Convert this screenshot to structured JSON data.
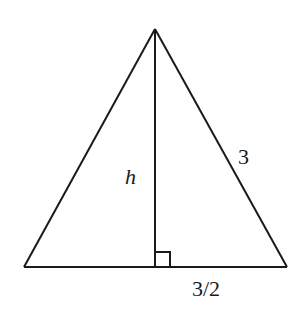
{
  "diagram": {
    "type": "isosceles-triangle-with-altitude",
    "vertices": {
      "apex": [
        155,
        29
      ],
      "bottom_left": [
        24,
        267
      ],
      "bottom_right": [
        287,
        267
      ],
      "altitude_foot": [
        155,
        267
      ]
    },
    "right_angle_marker": {
      "x": 155,
      "y": 252,
      "size": 15
    },
    "labels": {
      "height": {
        "text": "h",
        "x": 125,
        "y": 184
      },
      "side": {
        "text": "3",
        "x": 238,
        "y": 164
      },
      "half_base": {
        "text": "3/2",
        "x": 192,
        "y": 296
      }
    }
  }
}
